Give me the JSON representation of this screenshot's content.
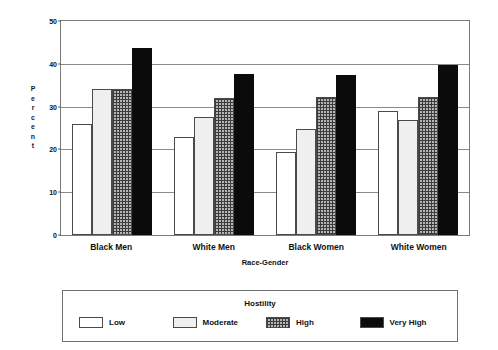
{
  "chart_data": {
    "type": "bar",
    "title": "",
    "xlabel": "Race-Gender",
    "ylabel": "Percent",
    "ylim": [
      0,
      50
    ],
    "yticks": [
      0,
      10,
      20,
      30,
      40,
      50
    ],
    "grid": true,
    "legend_title": "Hostility",
    "legend_position": "bottom",
    "categories": [
      "Black Men",
      "White Men",
      "Black Women",
      "White Women"
    ],
    "series": [
      {
        "name": "Low",
        "values": [
          26.0,
          23.0,
          19.5,
          29.0
        ],
        "color": "#ffffff",
        "pattern": "solid-white"
      },
      {
        "name": "Moderate",
        "values": [
          34.2,
          27.5,
          24.7,
          26.8
        ],
        "color": "#efefef",
        "pattern": "solid-light-gray"
      },
      {
        "name": "High",
        "values": [
          34.2,
          32.0,
          32.3,
          32.3
        ],
        "color": "#b5b5b5",
        "pattern": "crosshatch-grid"
      },
      {
        "name": "Very High",
        "values": [
          43.7,
          37.7,
          37.4,
          39.8
        ],
        "color": "#0b0b0b",
        "pattern": "solid-black"
      }
    ]
  },
  "axis": {
    "y_title_letters": [
      "P",
      "e",
      "r",
      "c",
      "e",
      "n",
      "t"
    ]
  }
}
